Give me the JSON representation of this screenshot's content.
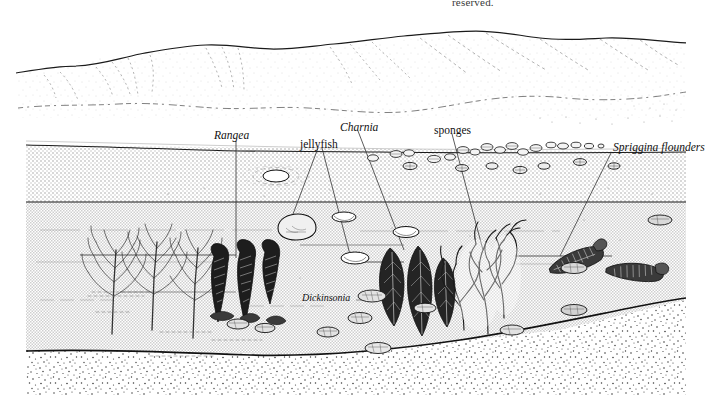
{
  "figure": {
    "type": "scientific-illustration",
    "clipped_header_text": "reserved.",
    "background_color": "#ffffff",
    "ink_color": "#111111"
  },
  "labels": [
    {
      "id": "rangea",
      "text": "Rangea",
      "style": "italic",
      "x": 214,
      "y": 130
    },
    {
      "id": "jellyfish",
      "text": "jellyfish",
      "style": "roman",
      "x": 300,
      "y": 139
    },
    {
      "id": "charnia",
      "text": "Charnia",
      "style": "italic",
      "x": 340,
      "y": 122
    },
    {
      "id": "sponges",
      "text": "sponges",
      "style": "roman",
      "x": 434,
      "y": 125
    },
    {
      "id": "spriggina",
      "text": "Spriggina flounders",
      "style": "italic",
      "x": 613,
      "y": 148
    },
    {
      "id": "dickinsonia",
      "text": "Dickinsonia",
      "style": "italic",
      "x": 302,
      "y": 298
    }
  ],
  "scene_regions": [
    {
      "id": "sky",
      "label": "sky",
      "fill": "#ffffff"
    },
    {
      "id": "mountains",
      "label": "distant mountain range",
      "fill": "#ffffff"
    },
    {
      "id": "shallow-water",
      "label": "upper water layer",
      "fill": "light stipple"
    },
    {
      "id": "deep-water",
      "label": "lower water layer",
      "fill": "medium stipple"
    },
    {
      "id": "seafloor",
      "label": "sandy seafloor",
      "fill": "coarse stipple"
    }
  ],
  "organisms": [
    {
      "id": "rangea",
      "common": "Rangea",
      "count": 3,
      "description": "branching frond-like fossils on left seafloor"
    },
    {
      "id": "charnia",
      "common": "Charnia",
      "count": 6,
      "description": "dark feather-shaped fronds"
    },
    {
      "id": "jellyfish",
      "common": "jellyfish",
      "count": 2,
      "description": "medusoid discs drifting in the water column"
    },
    {
      "id": "sponges",
      "common": "sponges",
      "count": 3,
      "description": "pale branching sponges"
    },
    {
      "id": "spriggina",
      "common": "Spriggina",
      "count": 2,
      "description": "elongated segmented animals"
    },
    {
      "id": "dickinsonia",
      "common": "Dickinsonia",
      "count": 14,
      "description": "flat oval segmented discs on the sea floor"
    }
  ]
}
